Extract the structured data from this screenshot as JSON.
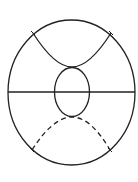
{
  "diagram": {
    "stroke_color": "#222222",
    "background": "#ffffff",
    "outer_ellipse": {
      "cx": 71.5,
      "cy": 92.5,
      "rx": 63.5,
      "ry": 72.5
    },
    "diameter": {
      "x1": 8,
      "y1": 92,
      "x2": 135,
      "y2": 92
    },
    "inner_ellipse": {
      "cx": 72,
      "cy": 92,
      "rx": 17.5,
      "ry": 24.5
    },
    "upper_curve": {
      "style": "solid",
      "path": "M33,33 C45,52 58,67 72,67 C86,67 99,52 111,33"
    },
    "lower_curve": {
      "style": "dashed",
      "path": "M32,150 C44,131 58,117 72,117 C86,117 99,131 110,150"
    },
    "ticks": [
      {
        "x": 33,
        "y": 33
      },
      {
        "x": 111,
        "y": 33
      },
      {
        "x": 32,
        "y": 150
      },
      {
        "x": 110,
        "y": 150
      }
    ]
  }
}
